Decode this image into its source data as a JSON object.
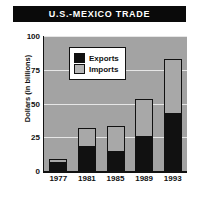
{
  "chart_data": {
    "type": "bar",
    "title": "U.S.-MEXICO TRADE",
    "xlabel": "",
    "ylabel": "Dollars (in billions)",
    "categories": [
      "1977",
      "1981",
      "1985",
      "1989",
      "1993"
    ],
    "series": [
      {
        "name": "Exports",
        "color": "#111111",
        "values": [
          6,
          18,
          14,
          25,
          42
        ]
      },
      {
        "name": "Imports",
        "color": "#a8a8a8",
        "values": [
          3,
          14,
          19,
          28,
          41
        ]
      }
    ],
    "stacked": true,
    "stack_totals": [
      9,
      32,
      33,
      53,
      83
    ],
    "ylim": [
      0,
      100
    ],
    "yticks": [
      0,
      25,
      50,
      75,
      100
    ],
    "ytick_labels": [
      "0",
      "25",
      "50",
      "75",
      "100"
    ],
    "grid": true,
    "legend_position": "upper left",
    "plot_background": "#a3a3a3",
    "title_background": "#0a0a0a",
    "title_color": "#ffffff"
  },
  "legend": {
    "items": [
      {
        "label": "Exports",
        "swatch": "black-square-icon"
      },
      {
        "label": "Imports",
        "swatch": "gray-square-icon"
      }
    ]
  },
  "caption": {
    "text": ""
  }
}
